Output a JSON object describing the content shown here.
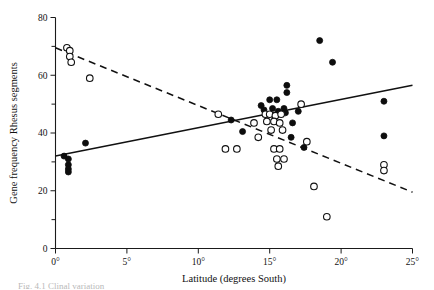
{
  "figure": {
    "caption_partial": "Fig. 4.1  Clinal variation",
    "background": "#ffffff",
    "ink": "#111111"
  },
  "chart_data": {
    "type": "scatter",
    "title": "",
    "xlabel": "Latitude (degrees South)",
    "ylabel": "Gene frequency Rhesus segments",
    "xlim": [
      0,
      25
    ],
    "ylim": [
      0,
      80
    ],
    "xticks": [
      0,
      5,
      10,
      15,
      20,
      25
    ],
    "xticklabels": [
      "0°",
      "5°",
      "10°",
      "15°",
      "20°",
      "25°"
    ],
    "yticks": [
      0,
      10,
      20,
      30,
      40,
      50,
      60,
      70,
      80
    ],
    "yticklabels_major": [
      "0",
      "20",
      "40",
      "60",
      "80"
    ],
    "ymajor": [
      0,
      20,
      40,
      60,
      80
    ],
    "yminor": [
      10,
      30,
      50,
      70
    ],
    "grid": false,
    "legend": null,
    "series": [
      {
        "name": "filled-circles",
        "marker": "filled circle",
        "color": "#0d0d0d",
        "points": [
          [
            0.6,
            32.0
          ],
          [
            0.9,
            31.0
          ],
          [
            0.9,
            29.0
          ],
          [
            0.9,
            27.5
          ],
          [
            0.9,
            26.5
          ],
          [
            2.1,
            36.5
          ],
          [
            12.3,
            44.5
          ],
          [
            13.1,
            40.5
          ],
          [
            14.4,
            49.5
          ],
          [
            14.6,
            48.0
          ],
          [
            15.0,
            51.5
          ],
          [
            15.5,
            51.5
          ],
          [
            15.2,
            48.5
          ],
          [
            15.6,
            47.5
          ],
          [
            16.0,
            48.5
          ],
          [
            16.1,
            47.0
          ],
          [
            16.2,
            54.0
          ],
          [
            16.2,
            56.5
          ],
          [
            16.6,
            43.5
          ],
          [
            17.0,
            47.5
          ],
          [
            16.5,
            38.5
          ],
          [
            17.4,
            35.0
          ],
          [
            18.5,
            72.0
          ],
          [
            19.4,
            64.5
          ],
          [
            23.0,
            51.0
          ],
          [
            23.0,
            39.0
          ]
        ]
      },
      {
        "name": "open-circles",
        "marker": "open circle",
        "color": "#ffffff",
        "points": [
          [
            0.8,
            69.5
          ],
          [
            1.0,
            68.5
          ],
          [
            1.0,
            66.5
          ],
          [
            1.1,
            64.5
          ],
          [
            2.4,
            59.0
          ],
          [
            11.4,
            46.5
          ],
          [
            11.9,
            34.5
          ],
          [
            12.7,
            34.5
          ],
          [
            13.9,
            43.5
          ],
          [
            14.2,
            38.5
          ],
          [
            14.7,
            46.5
          ],
          [
            15.0,
            46.5
          ],
          [
            15.4,
            46.0
          ],
          [
            15.8,
            46.5
          ],
          [
            14.8,
            44.0
          ],
          [
            15.3,
            44.0
          ],
          [
            15.7,
            43.5
          ],
          [
            15.1,
            41.0
          ],
          [
            15.9,
            41.0
          ],
          [
            15.3,
            34.5
          ],
          [
            15.7,
            34.5
          ],
          [
            15.5,
            31.0
          ],
          [
            16.0,
            31.0
          ],
          [
            15.6,
            28.5
          ],
          [
            17.2,
            50.0
          ],
          [
            17.6,
            37.0
          ],
          [
            18.1,
            21.5
          ],
          [
            19.0,
            11.0
          ],
          [
            23.0,
            29.0
          ],
          [
            23.0,
            27.0
          ]
        ]
      }
    ],
    "trendlines": [
      {
        "name": "solid-regression",
        "style": "solid",
        "slope_description": "positive",
        "endpoints": [
          [
            0,
            32.0
          ],
          [
            25,
            56.5
          ]
        ]
      },
      {
        "name": "dashed-regression",
        "style": "dashed",
        "slope_description": "negative",
        "endpoints": [
          [
            0,
            69.5
          ],
          [
            25,
            19.5
          ]
        ]
      }
    ]
  }
}
